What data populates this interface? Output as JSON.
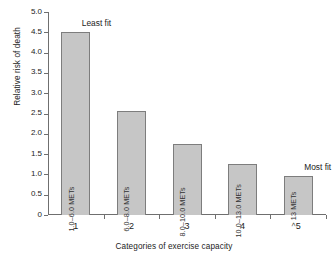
{
  "chart_data": {
    "type": "bar",
    "title": "",
    "xlabel": "Categories of exercise capacity",
    "ylabel": "Relative risk of death",
    "categories": [
      "1",
      "2",
      "3",
      "4",
      "5"
    ],
    "values": [
      4.5,
      2.55,
      1.75,
      1.25,
      0.95
    ],
    "bar_labels": [
      "1.0–6.0 METs",
      "6.0–8.0 METs",
      "8.0–10.0 METs",
      "10.0–13.0 METs",
      "> 13 METs"
    ],
    "ylim": [
      0,
      5.0
    ],
    "ytick_labels": [
      "0",
      "0.5",
      "1.0",
      "1.5",
      "2.0",
      "2.5",
      "3.0",
      "3.5",
      "4.0",
      "4.5",
      "5.0"
    ],
    "ytick_values": [
      0,
      0.5,
      1.0,
      1.5,
      2.0,
      2.5,
      3.0,
      3.5,
      4.0,
      4.5,
      5.0
    ],
    "grid": false,
    "legend": "none",
    "annotations": [
      {
        "text": "Least fit",
        "category": "1"
      },
      {
        "text": "Most fit",
        "category": "5"
      }
    ],
    "colors": {
      "bar_fill": "#c6c6c6",
      "bar_stroke": "#7d7d7d",
      "axis": "#6f6f6f",
      "text": "#1c1c1c",
      "background": "#ffffff"
    }
  }
}
